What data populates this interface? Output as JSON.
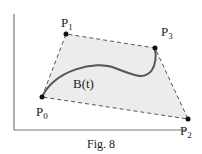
{
  "figure": {
    "caption": "Fig. 8",
    "curve_label": "B(t)",
    "points": [
      {
        "name": "P",
        "sub": "0",
        "x": 42,
        "y": 97
      },
      {
        "name": "P",
        "sub": "1",
        "x": 66,
        "y": 34
      },
      {
        "name": "P",
        "sub": "2",
        "x": 188,
        "y": 119
      },
      {
        "name": "P",
        "sub": "3",
        "x": 155,
        "y": 48
      }
    ],
    "colors": {
      "fill": "#ececec",
      "hull": "#555555",
      "curve": "#555555",
      "axis": "#777777",
      "point": "#111111"
    }
  }
}
